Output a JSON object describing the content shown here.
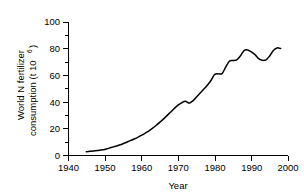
{
  "chart_data": {
    "type": "line",
    "title": "",
    "xlabel": "Year",
    "ylabel": "World N fertilizer consumption (t 10",
    "ylabel_exponent": "6",
    "ylabel_close": ")",
    "ylabel_line1": "World N fertilizer",
    "ylabel_line2": "consumption (t 10",
    "xlim": [
      1940,
      2000
    ],
    "ylim": [
      0,
      100
    ],
    "xticks": [
      1940,
      1950,
      1960,
      1970,
      1980,
      1990,
      2000
    ],
    "xtick_labels": [
      "1940",
      "1950",
      "1960",
      "1970",
      "1980",
      "1990",
      "2000"
    ],
    "yticks": [
      0,
      20,
      40,
      60,
      80,
      100
    ],
    "ytick_labels": [
      "0",
      "20",
      "40",
      "60",
      "80",
      "100"
    ],
    "y_minor_ticks": [
      10,
      30,
      50,
      70,
      90
    ],
    "grid": false,
    "legend": "none",
    "series": [
      {
        "name": "World N fertilizer consumption",
        "color": "#000000",
        "x": [
          1945,
          1946,
          1947,
          1948,
          1949,
          1950,
          1951,
          1952,
          1953,
          1954,
          1955,
          1956,
          1957,
          1958,
          1959,
          1960,
          1961,
          1962,
          1963,
          1964,
          1965,
          1966,
          1967,
          1968,
          1969,
          1970,
          1971,
          1972,
          1973,
          1974,
          1975,
          1976,
          1977,
          1978,
          1979,
          1980,
          1981,
          1982,
          1983,
          1984,
          1985,
          1986,
          1987,
          1988,
          1989,
          1990,
          1991,
          1992,
          1993,
          1994,
          1995,
          1996,
          1997,
          1998
        ],
        "values": [
          2.5,
          2.8,
          3.1,
          3.4,
          3.8,
          4.2,
          5.0,
          5.8,
          6.6,
          7.5,
          8.5,
          9.6,
          10.8,
          12.0,
          13.3,
          14.7,
          16.3,
          18.0,
          20.0,
          22.2,
          24.5,
          27.0,
          29.6,
          32.3,
          35.0,
          37.5,
          39.2,
          40.5,
          39.0,
          40.5,
          43.5,
          46.5,
          49.5,
          52.5,
          56.0,
          60.5,
          61.0,
          61.2,
          66.0,
          70.5,
          71.0,
          71.5,
          74.5,
          78.5,
          79.0,
          77.5,
          75.5,
          72.5,
          71.2,
          71.5,
          74.5,
          78.5,
          80.5,
          80.0
        ]
      }
    ]
  },
  "axis_geometry": {
    "plot_left": 68,
    "plot_right": 288,
    "plot_top": 22,
    "plot_bottom": 155
  }
}
